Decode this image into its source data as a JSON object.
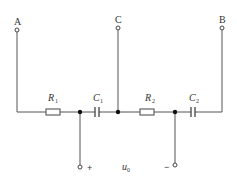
{
  "diagram": {
    "type": "circuit",
    "terminals": {
      "A": {
        "label": "A"
      },
      "B": {
        "label": "B"
      },
      "C": {
        "label": "C"
      },
      "plus": {
        "label": "+"
      },
      "minus": {
        "label": "−"
      }
    },
    "components": [
      {
        "id": "R1",
        "kind": "resistor",
        "symbol": "R",
        "sub": "1"
      },
      {
        "id": "C1",
        "kind": "capacitor",
        "symbol": "C",
        "sub": "1"
      },
      {
        "id": "R2",
        "kind": "resistor",
        "symbol": "R",
        "sub": "2"
      },
      {
        "id": "C2",
        "kind": "capacitor",
        "symbol": "C",
        "sub": "2"
      }
    ],
    "output": {
      "symbol": "u",
      "sub": "0"
    }
  }
}
